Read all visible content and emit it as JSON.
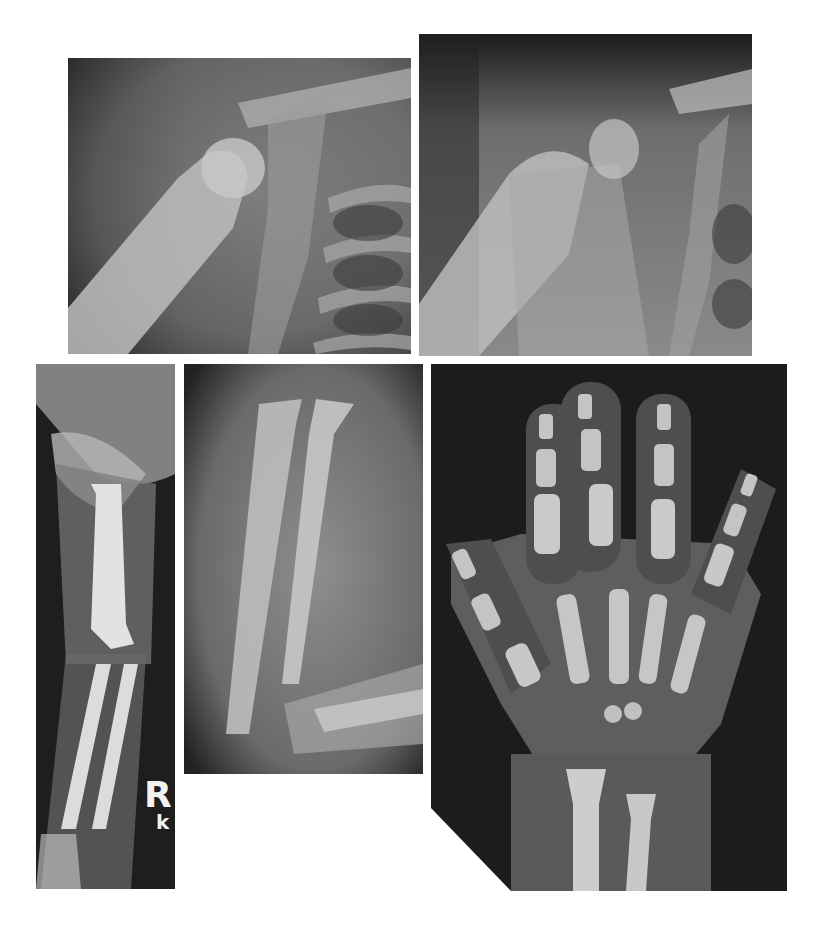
{
  "figure": {
    "panels": [
      {
        "id": "shoulder-1",
        "description": "Shoulder radiograph, proximal humerus, clavicle and upper ribs"
      },
      {
        "id": "shoulder-2",
        "description": "Shoulder radiograph, follow-up view of proximal humerus"
      },
      {
        "id": "arm",
        "description": "Full arm radiograph: humerus, elbow, radius and ulna"
      },
      {
        "id": "forearm",
        "description": "Forearm radiograph: radius and ulna shafts"
      },
      {
        "id": "hand",
        "description": "Hand and wrist radiograph: phalanges, metacarpals, distal radius and ulna"
      }
    ],
    "side_marker": {
      "letter": "R",
      "sub": "k"
    },
    "colors": {
      "background": "#ffffff",
      "film_dark": "#1c1c1c",
      "bone": "#cfcfcf",
      "soft_tissue": "#6e6e6e"
    }
  }
}
